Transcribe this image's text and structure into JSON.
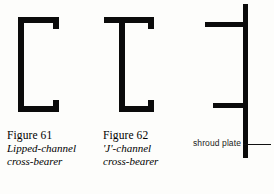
{
  "page": {
    "background_color": "#fdfdfb",
    "ink_color": "#000000"
  },
  "figures": [
    {
      "id": "figure-61",
      "number_label": "Figure 61",
      "title_label": "Lipped-channel",
      "subtitle_label": "cross-bearer",
      "drawing_name": "lipped-channel-section-drawing"
    },
    {
      "id": "figure-62",
      "number_label": "Figure 62",
      "title_label": "'J'-channel",
      "subtitle_label": "cross-bearer",
      "drawing_name": "j-channel-section-drawing"
    }
  ],
  "shroud": {
    "drawing_name": "shroud-plate-drawing",
    "annotation_label": "shroud plate"
  }
}
